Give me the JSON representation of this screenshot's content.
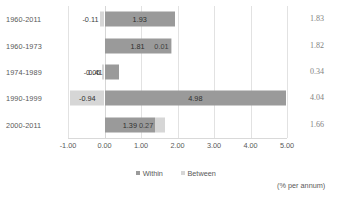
{
  "chart_data": {
    "type": "bar",
    "subtype": "stacked-horizontal",
    "title": "",
    "xlabel": "",
    "ylabel": "",
    "xlim": [
      -1.0,
      5.0
    ],
    "xticks": [
      "-1.00",
      "0.00",
      "1.00",
      "2.00",
      "3.00",
      "4.00",
      "5.00"
    ],
    "xtick_values": [
      -1.0,
      0.0,
      1.0,
      2.0,
      3.0,
      4.0,
      5.0
    ],
    "grid": true,
    "legend_position": "bottom-center",
    "categories": [
      "1960-2011",
      "1960-1973",
      "1974-1989",
      "1990-1999",
      "2000-2011"
    ],
    "series": [
      {
        "name": "Within",
        "color": "#9a9a9a",
        "values": [
          1.93,
          1.81,
          0.41,
          4.98,
          1.39
        ]
      },
      {
        "name": "Between",
        "color": "#d6d6d6",
        "values": [
          -0.11,
          0.01,
          -0.06,
          -0.94,
          0.27
        ]
      }
    ],
    "totals": [
      1.83,
      1.82,
      0.34,
      4.04,
      1.66
    ],
    "units_note": "(% per annum)"
  },
  "rows": [
    {
      "label": "1960-2011",
      "total": "1.83",
      "segments": [
        {
          "series": "Between",
          "value": -0.11,
          "label": "-0.11",
          "start": -0.11,
          "end": 0.0
        },
        {
          "series": "Within",
          "value": 1.93,
          "label": "1.93",
          "start": 0.0,
          "end": 1.93
        }
      ]
    },
    {
      "label": "1960-1973",
      "total": "1.82",
      "segments": [
        {
          "series": "Within",
          "value": 1.81,
          "label": "1.81",
          "start": 0.0,
          "end": 1.81
        },
        {
          "series": "Between",
          "value": 0.01,
          "label": "0.01",
          "start": 1.81,
          "end": 1.82
        }
      ]
    },
    {
      "label": "1974-1989",
      "total": "0.34",
      "segments": [
        {
          "series": "Between",
          "value": -0.06,
          "label": "-0.06",
          "start": -0.06,
          "end": 0.0
        },
        {
          "series": "Within",
          "value": 0.41,
          "label": "0.41",
          "start": 0.0,
          "end": 0.41
        }
      ]
    },
    {
      "label": "1990-1999",
      "total": "4.04",
      "segments": [
        {
          "series": "Between",
          "value": -0.94,
          "label": "-0.94",
          "start": -0.94,
          "end": 0.0
        },
        {
          "series": "Within",
          "value": 4.98,
          "label": "4.98",
          "start": 0.0,
          "end": 4.98
        }
      ]
    },
    {
      "label": "2000-2011",
      "total": "1.66",
      "segments": [
        {
          "series": "Within",
          "value": 1.39,
          "label": "1.39",
          "start": 0.0,
          "end": 1.39
        },
        {
          "series": "Between",
          "value": 0.27,
          "label": "0.27",
          "start": 1.39,
          "end": 1.66
        }
      ]
    }
  ],
  "legend": {
    "entries": [
      {
        "label": "Within",
        "color": "#9a9a9a"
      },
      {
        "label": "Between",
        "color": "#d6d6d6"
      }
    ]
  },
  "footnote": "(% per annum)",
  "axis": {
    "ticks": [
      "-1.00",
      "0.00",
      "1.00",
      "2.00",
      "3.00",
      "4.00",
      "5.00"
    ]
  }
}
